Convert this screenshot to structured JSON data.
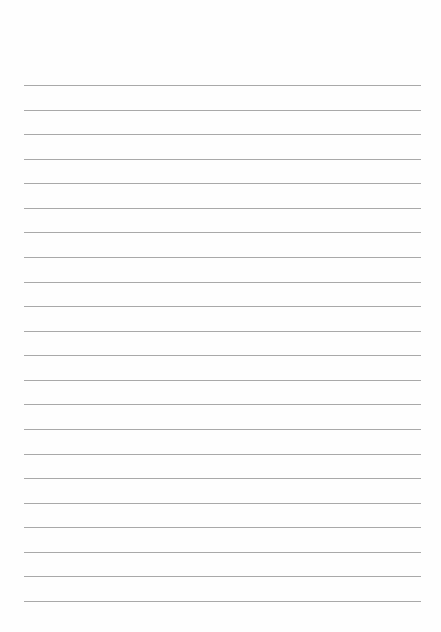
{
  "page": {
    "type": "ruled-lined-paper",
    "background_color": "#fefefe",
    "line_color": "#a9a9a9",
    "line_count": 22,
    "lines_y": [
      85,
      110,
      134,
      159,
      183,
      208,
      232,
      257,
      282,
      306,
      331,
      355,
      380,
      404,
      429,
      454,
      478,
      503,
      527,
      552,
      576,
      601
    ],
    "line_left": 24,
    "line_right": 421,
    "text": []
  }
}
